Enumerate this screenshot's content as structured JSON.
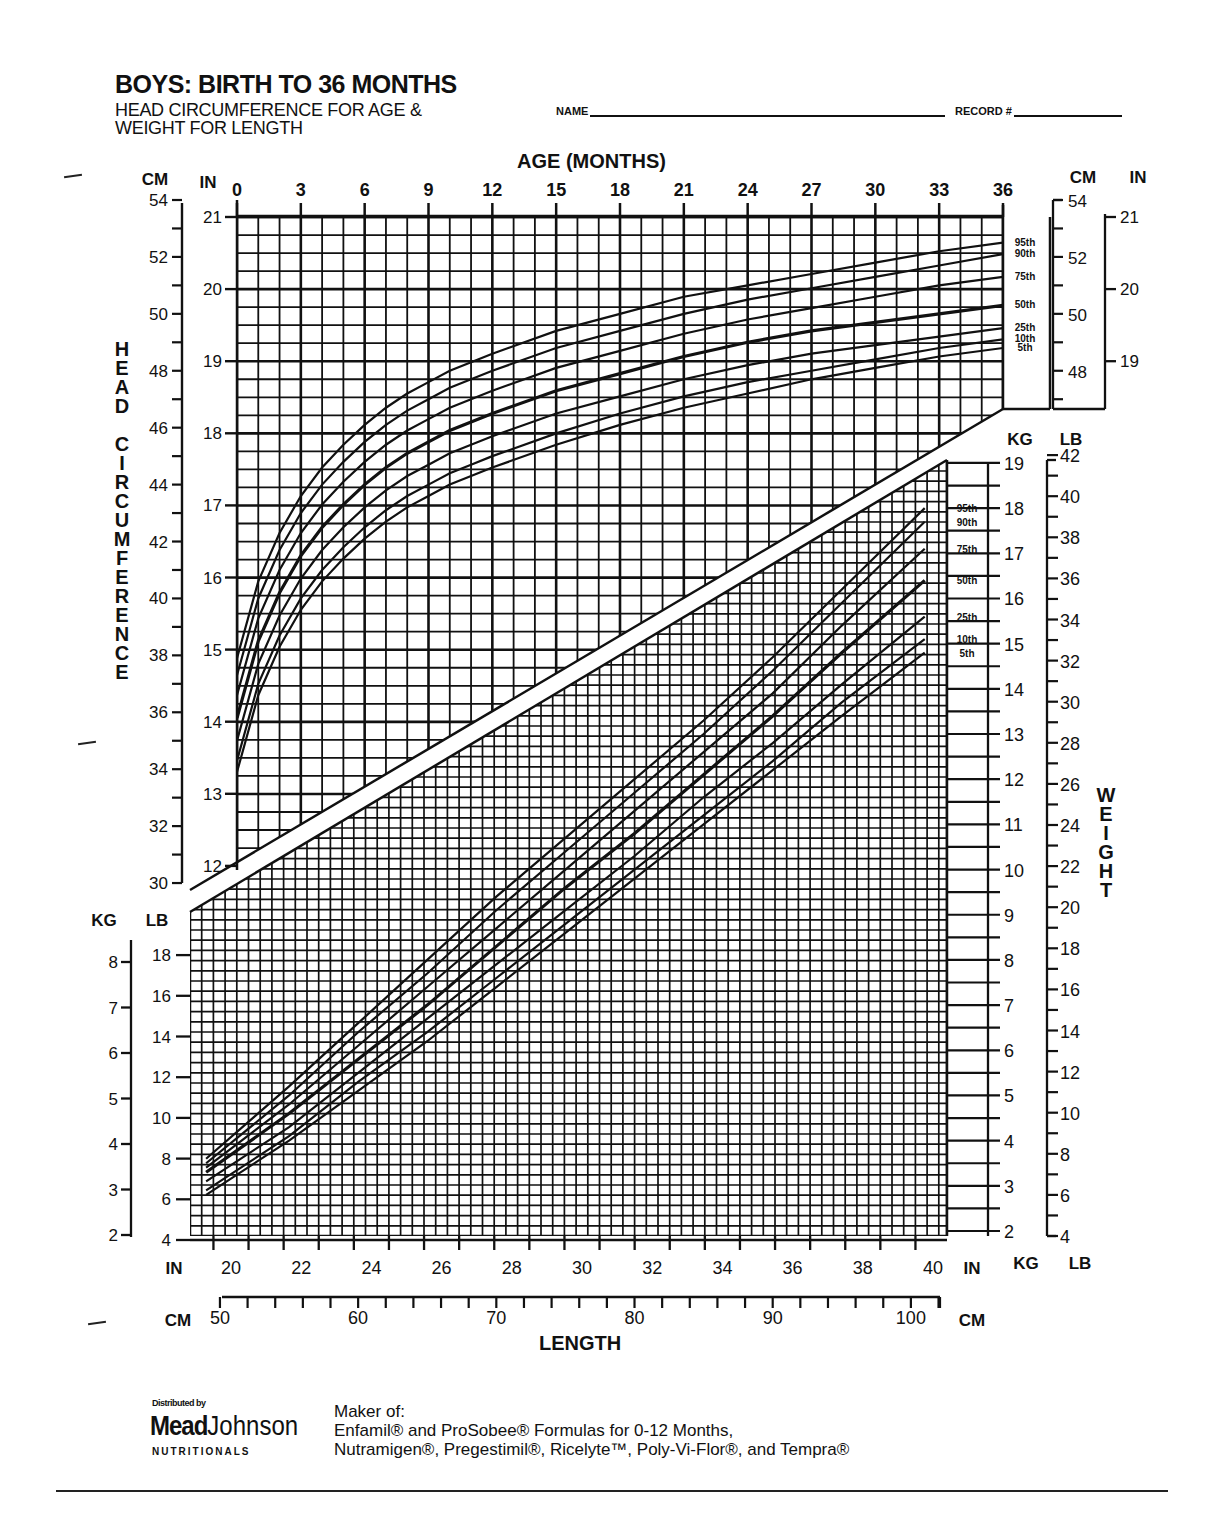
{
  "header": {
    "title": "BOYS: BIRTH TO 36 MONTHS",
    "subtitle_line1": "HEAD CIRCUMFERENCE FOR AGE &",
    "subtitle_line2": "WEIGHT FOR LENGTH",
    "name_label": "NAME",
    "name_value": "",
    "record_label": "RECORD #",
    "record_value": ""
  },
  "labels": {
    "age_axis_title": "AGE (MONTHS)",
    "head_axis_title": "HEAD CIRCUMFERENCE",
    "weight_axis_title": "WEIGHT",
    "length_axis_title": "LENGTH",
    "cm": "CM",
    "in": "IN",
    "kg": "KG",
    "lb": "LB"
  },
  "footer": {
    "distributed_by": "Distributed by",
    "logo_mead": "Mead",
    "logo_johnson": "Johnson",
    "logo_nutritionals": "NUTRITIONALS",
    "maker_line1": "Maker of:",
    "maker_line2": "Enfamil® and ProSobee®  Formulas for 0-12 Months,",
    "maker_line3": "Nutramigen®, Pregestimil®, Ricelyte™, Poly-Vi-Flor®, and Tempra®"
  },
  "colors": {
    "ink": "#111111",
    "paper": "#ffffff"
  },
  "chart_data": [
    {
      "type": "line",
      "title": "Head Circumference for Age",
      "xlabel": "AGE (MONTHS)",
      "ylabel": "HEAD CIRCUMFERENCE (CM)",
      "x_ticks": [
        0,
        3,
        6,
        9,
        12,
        15,
        18,
        21,
        24,
        27,
        30,
        33,
        36
      ],
      "xlim": [
        0,
        36
      ],
      "ylim_cm": [
        30,
        54
      ],
      "y_ticks_cm": [
        30,
        32,
        34,
        36,
        38,
        40,
        42,
        44,
        46,
        48,
        50,
        52,
        54
      ],
      "y_ticks_in": [
        12,
        13,
        14,
        15,
        16,
        17,
        18,
        19,
        20,
        21
      ],
      "right_y_ticks_cm": [
        48,
        50,
        52,
        54
      ],
      "right_y_ticks_in": [
        19,
        20,
        21
      ],
      "grid": true,
      "legend_position": "right",
      "x": [
        0,
        1,
        2,
        3,
        4,
        5,
        6,
        7,
        8,
        9,
        10,
        11,
        12,
        15,
        18,
        21,
        24,
        27,
        30,
        33,
        36
      ],
      "series": [
        {
          "name": "95th",
          "values": [
            37.9,
            40.6,
            42.3,
            43.6,
            44.6,
            45.4,
            46.1,
            46.7,
            47.2,
            47.6,
            48.0,
            48.3,
            48.6,
            49.4,
            50.0,
            50.6,
            51.0,
            51.4,
            51.8,
            52.2,
            52.5
          ]
        },
        {
          "name": "90th",
          "values": [
            37.3,
            40.0,
            41.7,
            43.0,
            44.0,
            44.8,
            45.5,
            46.1,
            46.6,
            47.0,
            47.4,
            47.7,
            48.0,
            48.8,
            49.4,
            50.0,
            50.5,
            50.9,
            51.3,
            51.7,
            52.1
          ]
        },
        {
          "name": "75th",
          "values": [
            36.6,
            39.3,
            41.0,
            42.3,
            43.3,
            44.1,
            44.8,
            45.4,
            45.9,
            46.3,
            46.7,
            47.0,
            47.3,
            48.1,
            48.7,
            49.3,
            49.8,
            50.2,
            50.6,
            51.0,
            51.3
          ]
        },
        {
          "name": "50th",
          "values": [
            35.8,
            38.5,
            40.2,
            41.5,
            42.5,
            43.3,
            44.0,
            44.6,
            45.1,
            45.5,
            45.9,
            46.2,
            46.5,
            47.3,
            47.9,
            48.5,
            49.0,
            49.4,
            49.7,
            50.0,
            50.3
          ]
        },
        {
          "name": "25th",
          "values": [
            35.0,
            37.7,
            39.4,
            40.7,
            41.7,
            42.5,
            43.2,
            43.8,
            44.3,
            44.7,
            45.1,
            45.4,
            45.7,
            46.5,
            47.1,
            47.7,
            48.2,
            48.6,
            48.9,
            49.2,
            49.5
          ]
        },
        {
          "name": "10th",
          "values": [
            34.3,
            37.0,
            38.7,
            40.0,
            41.0,
            41.8,
            42.5,
            43.1,
            43.6,
            44.0,
            44.4,
            44.7,
            45.0,
            45.8,
            46.5,
            47.1,
            47.6,
            48.0,
            48.4,
            48.8,
            49.1
          ]
        },
        {
          "name": "5th",
          "values": [
            33.9,
            36.6,
            38.3,
            39.6,
            40.6,
            41.4,
            42.1,
            42.7,
            43.2,
            43.6,
            44.0,
            44.3,
            44.6,
            45.4,
            46.1,
            46.7,
            47.2,
            47.7,
            48.1,
            48.5,
            48.8
          ]
        }
      ]
    },
    {
      "type": "line",
      "title": "Weight for Length",
      "xlabel": "LENGTH",
      "ylabel": "WEIGHT (KG)",
      "x_ticks_in": [
        20,
        22,
        24,
        26,
        28,
        30,
        32,
        34,
        36,
        38,
        40
      ],
      "x_ticks_cm": [
        50,
        60,
        70,
        80,
        90,
        100
      ],
      "left_y_ticks_kg": [
        2,
        3,
        4,
        5,
        6,
        7,
        8
      ],
      "left_y_ticks_lb": [
        4,
        6,
        8,
        10,
        12,
        14,
        16,
        18
      ],
      "right_y_ticks_kg": [
        2,
        3,
        4,
        5,
        6,
        7,
        8,
        9,
        10,
        11,
        12,
        13,
        14,
        15,
        16,
        17,
        18,
        19
      ],
      "right_y_ticks_lb": [
        4,
        6,
        8,
        10,
        12,
        14,
        16,
        18,
        20,
        22,
        24,
        26,
        28,
        30,
        32,
        34,
        36,
        38,
        40,
        42
      ],
      "ylim_kg": [
        2,
        19
      ],
      "grid": true,
      "legend_position": "right",
      "x_cm": [
        49,
        55,
        60,
        65,
        70,
        75,
        80,
        85,
        90,
        95,
        101
      ],
      "series": [
        {
          "name": "95th",
          "values": [
            3.6,
            5.2,
            6.6,
            8.0,
            9.4,
            10.7,
            12.0,
            13.3,
            14.7,
            16.2,
            18.0
          ]
        },
        {
          "name": "90th",
          "values": [
            3.5,
            5.0,
            6.4,
            7.7,
            9.1,
            10.4,
            11.7,
            13.0,
            14.4,
            15.9,
            17.7
          ]
        },
        {
          "name": "75th",
          "values": [
            3.4,
            4.8,
            6.1,
            7.4,
            8.7,
            10.0,
            11.3,
            12.6,
            13.9,
            15.4,
            17.1
          ]
        },
        {
          "name": "50th",
          "values": [
            3.3,
            4.6,
            5.8,
            7.0,
            8.3,
            9.6,
            10.8,
            12.1,
            13.4,
            14.8,
            16.4
          ]
        },
        {
          "name": "25th",
          "values": [
            3.1,
            4.3,
            5.5,
            6.7,
            7.9,
            9.1,
            10.3,
            11.6,
            12.8,
            14.1,
            15.6
          ]
        },
        {
          "name": "10th",
          "values": [
            2.9,
            4.1,
            5.3,
            6.4,
            7.6,
            8.8,
            10.0,
            11.2,
            12.4,
            13.7,
            15.1
          ]
        },
        {
          "name": "5th",
          "values": [
            2.8,
            4.0,
            5.1,
            6.2,
            7.4,
            8.6,
            9.8,
            11.0,
            12.2,
            13.4,
            14.8
          ]
        }
      ]
    }
  ]
}
